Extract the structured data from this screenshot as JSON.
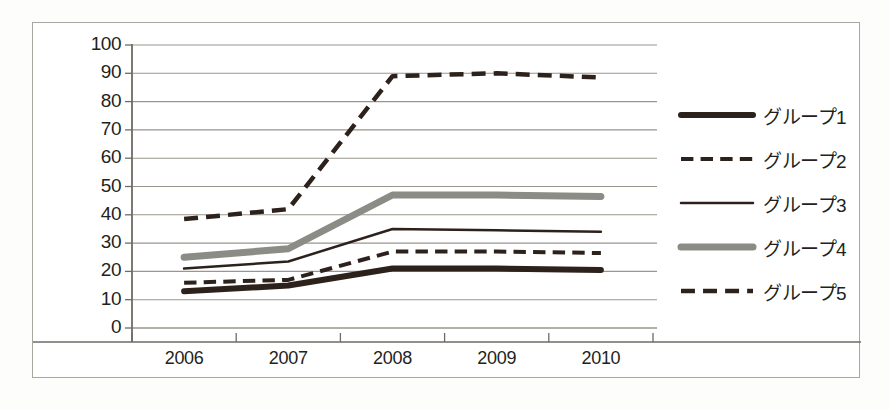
{
  "chart_data": {
    "type": "line",
    "title": "",
    "xlabel": "",
    "ylabel": "",
    "categories": [
      "2006",
      "2007",
      "2008",
      "2009",
      "2010"
    ],
    "ylim": [
      0,
      100
    ],
    "yticks": [
      0,
      10,
      20,
      30,
      40,
      50,
      60,
      70,
      80,
      90,
      100
    ],
    "grid": true,
    "legend_position": "right",
    "series": [
      {
        "name": "グループ1",
        "values": [
          13,
          15,
          21,
          21,
          20.5
        ],
        "style": "solid",
        "width": 6,
        "color": "#2d211c"
      },
      {
        "name": "グループ2",
        "values": [
          16,
          17,
          27,
          27,
          26.5
        ],
        "style": "dashed",
        "width": 4,
        "color": "#2d211c"
      },
      {
        "name": "グループ3",
        "values": [
          21,
          23.5,
          35,
          34.5,
          34
        ],
        "style": "solid",
        "width": 2.5,
        "color": "#2d211c"
      },
      {
        "name": "グループ4",
        "values": [
          25,
          28,
          47,
          47,
          46.5
        ],
        "style": "solid",
        "width": 7,
        "color": "#8c8c86"
      },
      {
        "name": "グループ5",
        "values": [
          38.5,
          42,
          89,
          90,
          88.5
        ],
        "style": "dashed",
        "width": 4.5,
        "color": "#2d211c"
      }
    ]
  },
  "axis": {
    "y_tick_labels": [
      "100",
      "90",
      "80",
      "70",
      "60",
      "50",
      "40",
      "30",
      "20",
      "10",
      "0"
    ],
    "x_tick_labels": [
      "2006",
      "2007",
      "2008",
      "2009",
      "2010"
    ]
  },
  "legend": {
    "entries": [
      {
        "label": "グループ1",
        "swatch": "thick-solid-dark"
      },
      {
        "label": "グループ2",
        "swatch": "dashed-dark"
      },
      {
        "label": "グループ3",
        "swatch": "thin-solid-dark"
      },
      {
        "label": "グループ4",
        "swatch": "thick-solid-gray"
      },
      {
        "label": "グループ5",
        "swatch": "thick-dashed-dark"
      }
    ]
  },
  "colors": {
    "dark": "#2d211c",
    "gray": "#8c8c86",
    "grid": "#9a968e",
    "axis": "#6f6b64",
    "frame": "#a8a8a0",
    "background": "#ffffff"
  }
}
